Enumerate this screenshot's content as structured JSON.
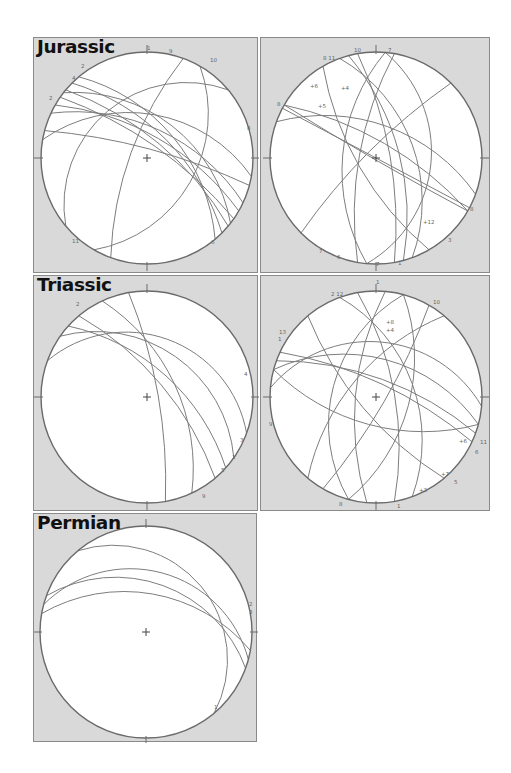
{
  "figure": {
    "type": "stereonet-great-circles",
    "panels": [
      {
        "id": "jurassic-main",
        "title": "Jurassic",
        "box": {
          "x": 33,
          "y": 37,
          "w": 225,
          "h": 236
        },
        "net": {
          "cx": 113,
          "cy": 120,
          "r": 106
        },
        "planes": [
          {
            "dipdir": 225,
            "dip": 62,
            "label": "2"
          },
          {
            "dipdir": 220,
            "dip": 70,
            "label": "3"
          },
          {
            "dipdir": 215,
            "dip": 75,
            "label": "4"
          },
          {
            "dipdir": 230,
            "dip": 55,
            "label": "5"
          },
          {
            "dipdir": 210,
            "dip": 66,
            "label": ""
          },
          {
            "dipdir": 205,
            "dip": 58,
            "label": ""
          },
          {
            "dipdir": 218,
            "dip": 48,
            "label": "6"
          },
          {
            "dipdir": 195,
            "dip": 80,
            "label": ""
          },
          {
            "dipdir": 300,
            "dip": 40,
            "label": "1"
          },
          {
            "dipdir": 110,
            "dip": 72,
            "label": "10"
          },
          {
            "dipdir": 140,
            "dip": 30,
            "label": "11"
          },
          {
            "dipdir": 190,
            "dip": 45,
            "label": ""
          }
        ],
        "labels": [
          {
            "text": "1",
            "x": 113,
            "y": 12
          },
          {
            "text": "9",
            "x": 135,
            "y": 15
          },
          {
            "text": "10",
            "x": 176,
            "y": 24
          },
          {
            "text": "2",
            "x": 47,
            "y": 30
          },
          {
            "text": "4",
            "x": 38,
            "y": 42
          },
          {
            "text": "2",
            "x": 15,
            "y": 62
          },
          {
            "text": "11",
            "x": 38,
            "y": 205
          },
          {
            "text": "8",
            "x": 213,
            "y": 92
          },
          {
            "text": "6",
            "x": 177,
            "y": 206
          }
        ]
      },
      {
        "id": "jurassic-second",
        "title": "",
        "box": {
          "x": 260,
          "y": 37,
          "w": 230,
          "h": 236
        },
        "net": {
          "cx": 115,
          "cy": 120,
          "r": 106
        },
        "planes": [
          {
            "dipdir": 28,
            "dip": 90,
            "label": "8"
          },
          {
            "dipdir": 30,
            "dip": 88,
            "label": ""
          },
          {
            "dipdir": 250,
            "dip": 50,
            "label": "7"
          },
          {
            "dipdir": 255,
            "dip": 65,
            "label": ""
          },
          {
            "dipdir": 260,
            "dip": 75,
            "label": ""
          },
          {
            "dipdir": 95,
            "dip": 55,
            "label": "3"
          },
          {
            "dipdir": 100,
            "dip": 72,
            "label": "1"
          },
          {
            "dipdir": 275,
            "dip": 35,
            "label": "10"
          },
          {
            "dipdir": 200,
            "dip": 55,
            "label": "12"
          },
          {
            "dipdir": 210,
            "dip": 72,
            "label": ""
          },
          {
            "dipdir": 60,
            "dip": 70,
            "label": "6"
          },
          {
            "dipdir": 135,
            "dip": 80,
            "label": ""
          }
        ],
        "labels": [
          {
            "text": "10",
            "x": 93,
            "y": 14
          },
          {
            "text": "7",
            "x": 127,
            "y": 14
          },
          {
            "text": "8 11",
            "x": 62,
            "y": 22
          },
          {
            "text": "+4",
            "x": 80,
            "y": 52
          },
          {
            "text": "+6",
            "x": 49,
            "y": 50
          },
          {
            "text": "+5",
            "x": 57,
            "y": 70
          },
          {
            "text": "8",
            "x": 16,
            "y": 68
          },
          {
            "text": "+12",
            "x": 162,
            "y": 186
          },
          {
            "text": "8",
            "x": 209,
            "y": 173
          },
          {
            "text": "3",
            "x": 187,
            "y": 204
          },
          {
            "text": "7",
            "x": 58,
            "y": 215
          },
          {
            "text": "6",
            "x": 76,
            "y": 221
          },
          {
            "text": "7",
            "x": 115,
            "y": 228
          },
          {
            "text": "1",
            "x": 137,
            "y": 227
          }
        ]
      },
      {
        "id": "triassic-main",
        "title": "Triassic",
        "box": {
          "x": 33,
          "y": 275,
          "w": 225,
          "h": 236
        },
        "net": {
          "cx": 113,
          "cy": 121,
          "r": 106
        },
        "planes": [
          {
            "dipdir": 230,
            "dip": 70,
            "label": "1"
          },
          {
            "dipdir": 222,
            "dip": 60,
            "label": "5"
          },
          {
            "dipdir": 215,
            "dip": 40,
            "label": "3"
          },
          {
            "dipdir": 245,
            "dip": 58,
            "label": "6"
          },
          {
            "dipdir": 260,
            "dip": 78,
            "label": "9"
          },
          {
            "dipdir": 200,
            "dip": 30,
            "label": "4"
          }
        ],
        "labels": [
          {
            "text": "2",
            "x": 42,
            "y": 30
          },
          {
            "text": "4",
            "x": 210,
            "y": 100
          },
          {
            "text": "3",
            "x": 206,
            "y": 166
          },
          {
            "text": "1",
            "x": 198,
            "y": 183
          },
          {
            "text": "5",
            "x": 187,
            "y": 196
          },
          {
            "text": "9",
            "x": 168,
            "y": 222
          }
        ]
      },
      {
        "id": "triassic-second",
        "title": "",
        "box": {
          "x": 260,
          "y": 275,
          "w": 230,
          "h": 236
        },
        "net": {
          "cx": 115,
          "cy": 121,
          "r": 106
        },
        "planes": [
          {
            "dipdir": 200,
            "dip": 70,
            "label": "11"
          },
          {
            "dipdir": 205,
            "dip": 75,
            "label": "6"
          },
          {
            "dipdir": 195,
            "dip": 50,
            "label": "3"
          },
          {
            "dipdir": 185,
            "dip": 35,
            "label": "9"
          },
          {
            "dipdir": 15,
            "dip": 60,
            "label": "2"
          },
          {
            "dipdir": 250,
            "dip": 50,
            "label": "8"
          },
          {
            "dipdir": 260,
            "dip": 70,
            "label": ""
          },
          {
            "dipdir": 95,
            "dip": 68,
            "label": "4"
          },
          {
            "dipdir": 105,
            "dip": 45,
            "label": "1"
          },
          {
            "dipdir": 285,
            "dip": 55,
            "label": "10"
          },
          {
            "dipdir": 130,
            "dip": 62,
            "label": "12"
          },
          {
            "dipdir": 300,
            "dip": 80,
            "label": "7"
          },
          {
            "dipdir": 50,
            "dip": 72,
            "label": "5"
          }
        ],
        "labels": [
          {
            "text": "1",
            "x": 115,
            "y": 8
          },
          {
            "text": "2 12",
            "x": 70,
            "y": 20
          },
          {
            "text": "10",
            "x": 172,
            "y": 28
          },
          {
            "text": "+8",
            "x": 125,
            "y": 48
          },
          {
            "text": "+4",
            "x": 125,
            "y": 56
          },
          {
            "text": "13",
            "x": 18,
            "y": 58
          },
          {
            "text": "1",
            "x": 17,
            "y": 65
          },
          {
            "text": "9",
            "x": 8,
            "y": 150
          },
          {
            "text": "+6",
            "x": 198,
            "y": 167
          },
          {
            "text": "11",
            "x": 219,
            "y": 168
          },
          {
            "text": "6",
            "x": 214,
            "y": 178
          },
          {
            "text": "+7",
            "x": 180,
            "y": 200
          },
          {
            "text": "5",
            "x": 193,
            "y": 208
          },
          {
            "text": "+3",
            "x": 158,
            "y": 216
          },
          {
            "text": "8",
            "x": 78,
            "y": 230
          },
          {
            "text": "1",
            "x": 136,
            "y": 232
          }
        ]
      },
      {
        "id": "permian-main",
        "title": "Permian",
        "box": {
          "x": 33,
          "y": 513,
          "w": 224,
          "h": 229
        },
        "net": {
          "cx": 112,
          "cy": 118,
          "r": 106
        },
        "planes": [
          {
            "dipdir": 195,
            "dip": 30,
            "label": "2"
          },
          {
            "dipdir": 200,
            "dip": 40,
            "label": "3"
          },
          {
            "dipdir": 190,
            "dip": 50,
            "label": ""
          },
          {
            "dipdir": 230,
            "dip": 22,
            "label": "1"
          }
        ],
        "labels": [
          {
            "text": "2",
            "x": 215,
            "y": 92
          },
          {
            "text": "3",
            "x": 215,
            "y": 100
          },
          {
            "text": "1",
            "x": 180,
            "y": 195
          }
        ]
      }
    ]
  }
}
